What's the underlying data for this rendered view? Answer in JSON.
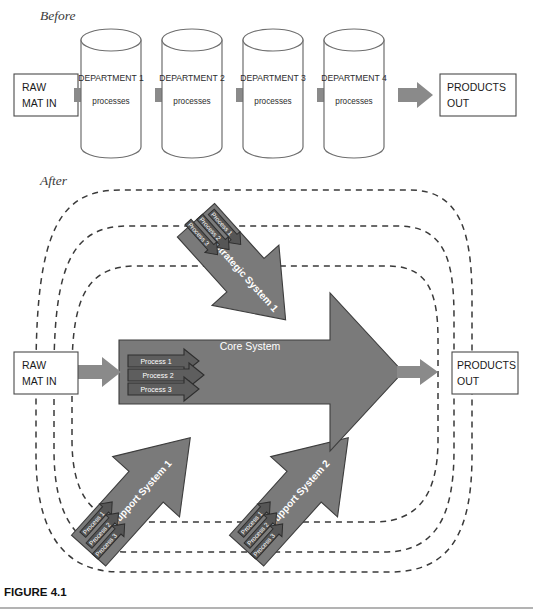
{
  "figure": {
    "caption": "FIGURE 4.1",
    "sections": {
      "before_label": "Before",
      "after_label": "After"
    }
  },
  "before": {
    "input_box": "RAW\nMAT IN",
    "input_box_line1": "RAW",
    "input_box_line2": "MAT IN",
    "output_box_line1": "PRODUCTS",
    "output_box_line2": "OUT",
    "departments": [
      {
        "title": "DEPARTMENT 1",
        "subtitle": "processes"
      },
      {
        "title": "DEPARTMENT 2",
        "subtitle": "processes"
      },
      {
        "title": "DEPARTMENT 3",
        "subtitle": "processes"
      },
      {
        "title": "DEPARTMENT 4",
        "subtitle": "processes"
      }
    ]
  },
  "after": {
    "input_box_line1": "RAW",
    "input_box_line2": "MAT IN",
    "output_box_line1": "PRODUCTS",
    "output_box_line2": "OUT",
    "core_system": {
      "label": "Core System",
      "processes": [
        "Process 1",
        "Process 2",
        "Process 3"
      ]
    },
    "strategic_system": {
      "label": "Strategic System 1",
      "processes": [
        "Process 1",
        "Process 2",
        "Process 3"
      ]
    },
    "support_system_1": {
      "label": "Support System 1",
      "processes": [
        "Process 1",
        "Process 2",
        "Process 3"
      ]
    },
    "support_system_2": {
      "label": "Support System 2",
      "processes": [
        "Process 1",
        "Process 2",
        "Process 3"
      ]
    },
    "feedback_loops": 3
  },
  "colors": {
    "system_fill": "#7a7a7a",
    "process_fill": "#565656",
    "flow_arrow": "#8a8a8a",
    "dashed_loop": "#3a3a3a",
    "cylinder_stroke": "#6e6e6e",
    "box_stroke": "#4a4a4a",
    "background": "#ffffff"
  }
}
